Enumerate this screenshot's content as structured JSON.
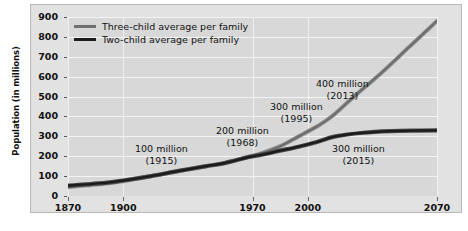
{
  "chart_data": {
    "type": "line",
    "title": "",
    "xlabel": "",
    "ylabel": "Population (in millions)",
    "xlim": [
      1870,
      2070
    ],
    "ylim": [
      0,
      900
    ],
    "grid": true,
    "legend_position": "top-left",
    "xticks": [
      1870,
      1900,
      1970,
      2000,
      2070
    ],
    "xtick_labels": [
      "1870",
      "1900",
      "1970",
      "2000",
      "2070"
    ],
    "yticks": [
      0,
      100,
      200,
      300,
      400,
      500,
      600,
      700,
      800,
      900
    ],
    "ytick_labels": [
      "0",
      "100",
      "200",
      "300",
      "400",
      "500",
      "600",
      "700",
      "800",
      "900"
    ],
    "series": [
      {
        "name": "Three-child average per family",
        "color": "#6e6e6e",
        "x": [
          1870,
          1890,
          1900,
          1915,
          1930,
          1945,
          1955,
          1968,
          1975,
          1985,
          1995,
          2005,
          2013,
          2025,
          2040,
          2055,
          2070
        ],
        "values": [
          45,
          62,
          75,
          100,
          125,
          150,
          165,
          198,
          215,
          250,
          300,
          350,
          400,
          500,
          620,
          750,
          880
        ]
      },
      {
        "name": "Two-child average per family",
        "color": "#1c1c1c",
        "x": [
          1870,
          1890,
          1900,
          1915,
          1930,
          1945,
          1955,
          1968,
          1975,
          1985,
          1995,
          2005,
          2015,
          2030,
          2045,
          2060,
          2070
        ],
        "values": [
          52,
          66,
          78,
          100,
          126,
          150,
          166,
          196,
          208,
          228,
          248,
          272,
          300,
          318,
          326,
          329,
          330
        ]
      }
    ],
    "annotations": [
      {
        "amount": "100 million",
        "year": "(1915)"
      },
      {
        "amount": "200 million",
        "year": "(1968)"
      },
      {
        "amount": "300 million",
        "year": "(1995)"
      },
      {
        "amount": "400 million",
        "year": "(2013)"
      },
      {
        "amount": "300 million",
        "year": "(2015)"
      }
    ]
  },
  "legend": {
    "entries": [
      {
        "label": "Three-child average per family"
      },
      {
        "label": "Two-child average per family"
      }
    ]
  }
}
